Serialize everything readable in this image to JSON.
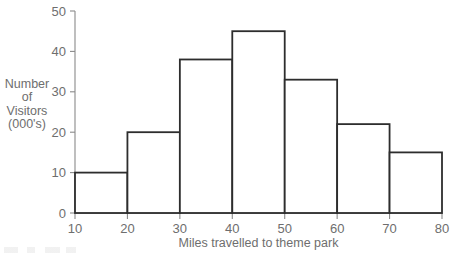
{
  "chart_data": {
    "type": "bar",
    "title": "",
    "subtitle": "",
    "xlabel": "Miles travelled to theme park",
    "ylabel": "Number of Visitors (000's)",
    "ylabel_lines": [
      "Number",
      "of",
      "Visitors",
      "(000's)"
    ],
    "categories": [
      "10-20",
      "20-30",
      "30-40",
      "40-50",
      "50-60",
      "60-70",
      "70-80"
    ],
    "bin_edges": [
      10,
      20,
      30,
      40,
      50,
      60,
      70,
      80
    ],
    "values": [
      10,
      20,
      38,
      45,
      33,
      22,
      15
    ],
    "xlim": [
      10,
      80
    ],
    "ylim": [
      0,
      50
    ],
    "x_ticks": [
      "10",
      "20",
      "30",
      "40",
      "50",
      "60",
      "70",
      "80"
    ],
    "x_tick_values": [
      10,
      20,
      30,
      40,
      50,
      60,
      70,
      80
    ],
    "y_ticks": [
      "0",
      "10",
      "20",
      "30",
      "40",
      "50"
    ],
    "y_tick_values": [
      0,
      10,
      20,
      30,
      40,
      50
    ],
    "grid": false,
    "legend": false,
    "legend_position": "none",
    "bar_fill_color": "#ffffff",
    "bar_stroke_color": "#2d2d2d",
    "axis_color": "#8a8a8a",
    "text_color": "#6e6e6e",
    "background_color": "#ffffff"
  }
}
